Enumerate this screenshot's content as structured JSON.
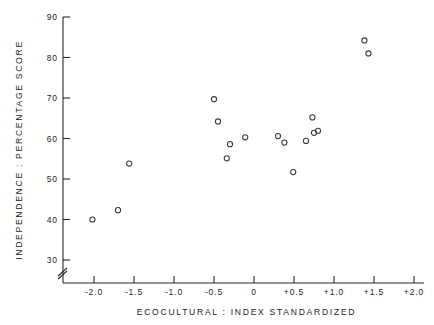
{
  "chart_data": {
    "type": "scatter",
    "title": "",
    "xlabel": "ECOCULTURAL : INDEX STANDARDIZED",
    "ylabel": "INDEPENDENCE : PERCENTAGE SCORE",
    "xlim": [
      -2.25,
      2.1
    ],
    "ylim": [
      26,
      90
    ],
    "grid": false,
    "legend": null,
    "axis_break": {
      "axis": "y",
      "note": "zig-zag break below 30 on y-axis and at left end of x-axis"
    },
    "xticks": [
      -2.0,
      -1.5,
      -1.0,
      -0.5,
      0,
      0.5,
      1.0,
      1.5,
      2.0
    ],
    "xticklabels": [
      "-2.0",
      "-1.5",
      "-1.0",
      "-0.5",
      "0",
      "+0.5",
      "+1.0",
      "+1.5",
      "+2.0"
    ],
    "yticks": [
      30,
      40,
      50,
      60,
      70,
      80,
      90
    ],
    "yticklabels": [
      "30",
      "40",
      "50",
      "60",
      "70",
      "80",
      "90"
    ],
    "marker": "open-circle",
    "marker_color": "#3a3a3a",
    "points": [
      {
        "x": -2.02,
        "y": 40.0
      },
      {
        "x": -1.7,
        "y": 42.3
      },
      {
        "x": -1.56,
        "y": 53.8
      },
      {
        "x": -0.5,
        "y": 69.7
      },
      {
        "x": -0.45,
        "y": 64.2
      },
      {
        "x": -0.34,
        "y": 55.1
      },
      {
        "x": -0.3,
        "y": 58.6
      },
      {
        "x": -0.11,
        "y": 60.3
      },
      {
        "x": 0.3,
        "y": 60.6
      },
      {
        "x": 0.38,
        "y": 59.0
      },
      {
        "x": 0.49,
        "y": 51.7
      },
      {
        "x": 0.65,
        "y": 59.4
      },
      {
        "x": 0.73,
        "y": 65.2
      },
      {
        "x": 0.75,
        "y": 61.4
      },
      {
        "x": 0.8,
        "y": 61.9
      },
      {
        "x": 1.38,
        "y": 84.2
      },
      {
        "x": 1.43,
        "y": 81.0
      }
    ]
  },
  "axes": {
    "x_title": "ECOCULTURAL : INDEX STANDARDIZED",
    "y_title": "INDEPENDENCE : PERCENTAGE SCORE"
  }
}
